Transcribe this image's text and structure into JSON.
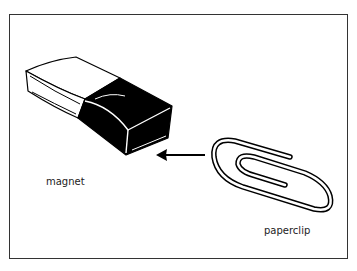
{
  "diagram": {
    "labels": {
      "magnet": "magnet",
      "paperclip": "paperclip"
    },
    "objects": [
      {
        "name": "magnet",
        "icon": "magnet-icon"
      },
      {
        "name": "paperclip",
        "icon": "paperclip-icon"
      }
    ],
    "arrow": {
      "direction": "left",
      "from": "paperclip",
      "to": "magnet"
    },
    "colors": {
      "ink": "#000000",
      "frame": "#333333",
      "background": "#ffffff"
    }
  }
}
